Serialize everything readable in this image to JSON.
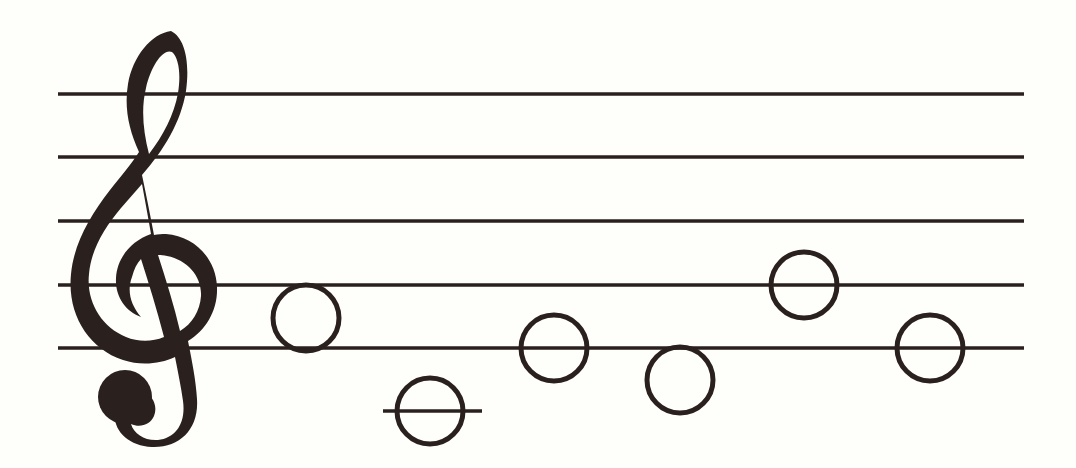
{
  "page": {
    "background_color": "#fefefa",
    "ink_color": "#2a211e",
    "width": 1076,
    "height": 468
  },
  "staff": {
    "name": "five-line-staff",
    "line_count": 5,
    "line_x_start": 58,
    "line_x_end": 1024,
    "line_thickness": 3.5,
    "line_color": "#2a211e",
    "line_y_positions": [
      94,
      157,
      221,
      285,
      348
    ],
    "line_spacing": 63.5
  },
  "clef": {
    "name": "treble-clef",
    "label": "Treble Clef (G clef)",
    "symbol": "𝄞",
    "x": 70,
    "y_top": 30,
    "y_bottom": 440,
    "width": 135,
    "height": 410,
    "color": "#2a211e",
    "dot_center_x": 125,
    "dot_center_y": 397,
    "dot_radius": 27
  },
  "notes": {
    "head_style": "whole-note-open-circle",
    "head_radius": 33,
    "head_stroke_width": 5,
    "head_color": "#2a211e",
    "items": [
      {
        "index": 1,
        "name": "note-1",
        "pitch": "C5",
        "cx": 306,
        "cy": 318,
        "position": "space-below-fourth-line",
        "ledger": false
      },
      {
        "index": 2,
        "name": "note-2",
        "pitch": "C4",
        "cx": 430,
        "cy": 411,
        "position": "first-ledger-line-below-staff",
        "ledger": true,
        "ledger_x_start": 383,
        "ledger_x_end": 482,
        "ledger_y": 411
      },
      {
        "index": 3,
        "name": "note-3",
        "pitch": "E4",
        "cx": 554,
        "cy": 348,
        "position": "on-bottom-line",
        "ledger": false
      },
      {
        "index": 4,
        "name": "note-4",
        "pitch": "D4",
        "cx": 680,
        "cy": 380,
        "position": "space-below-bottom-line",
        "ledger": false
      },
      {
        "index": 5,
        "name": "note-5",
        "pitch": "G4",
        "cx": 804,
        "cy": 285,
        "position": "on-fourth-line",
        "ledger": false
      },
      {
        "index": 6,
        "name": "note-6",
        "pitch": "E4",
        "cx": 930,
        "cy": 348,
        "position": "on-bottom-line",
        "ledger": false
      }
    ]
  }
}
